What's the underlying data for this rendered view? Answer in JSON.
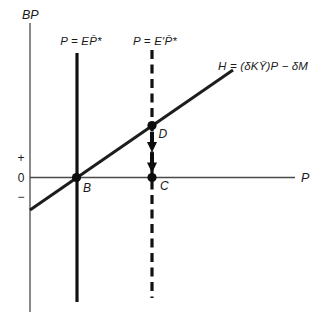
{
  "figure": {
    "title_hint": "BP schedule diagram with fixed price lines",
    "colors": {
      "background": "#ffffff",
      "ink": "#1a1a1a",
      "axis": "#4a4a4a"
    },
    "axes": {
      "y_label": "BP",
      "x_label": "P",
      "ticks": {
        "plus": "+",
        "zero": "0",
        "minus": "−"
      }
    },
    "lines": {
      "solid_vertical_label": "P = EP̄*",
      "dashed_vertical_label": "P = E′P̄*",
      "h_schedule_label": "H = (δKȲ)P − δM"
    },
    "points": {
      "b": "B",
      "c": "C",
      "d": "D"
    }
  }
}
